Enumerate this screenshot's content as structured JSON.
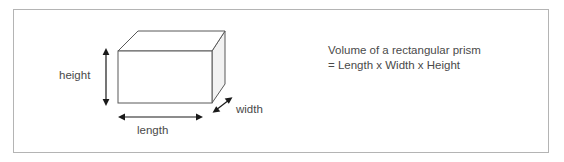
{
  "figure": {
    "frame": {
      "border_color": "#b4b4b4",
      "background_color": "#ffffff"
    },
    "prism": {
      "name": "rectangular-prism",
      "front_face_color": "#ffffff",
      "top_face_color": "#ffffff",
      "side_face_color": "#f2f2f2",
      "stroke_color": "#595959"
    },
    "dimension_labels": {
      "height": "height",
      "length": "length",
      "width": "width"
    },
    "formula": {
      "line1": "Volume of a rectangular prism",
      "line2": "= Length x Width x Height"
    },
    "text_color": "#4a4a4a"
  }
}
